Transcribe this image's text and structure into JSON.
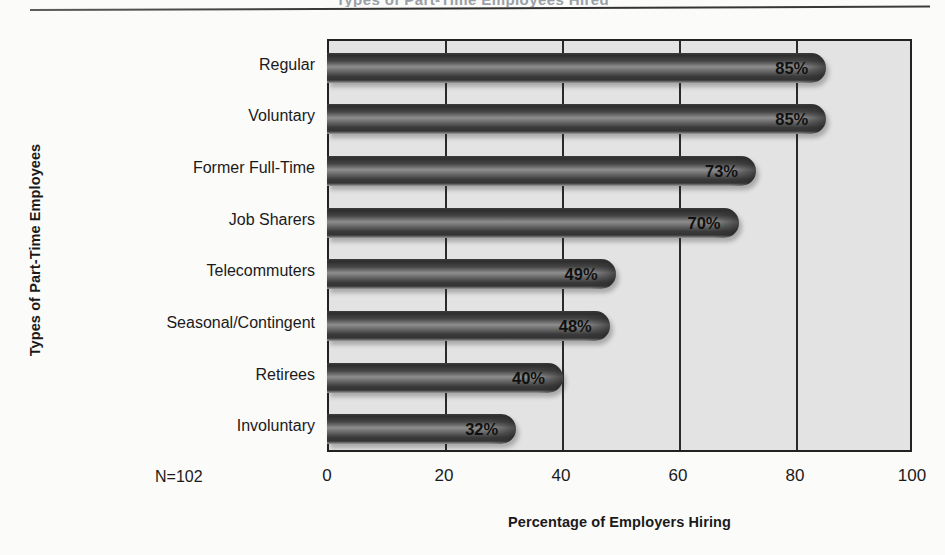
{
  "page": {
    "cropped_title": "Types of Part-Time Employees Hired",
    "sample_note": "N=102"
  },
  "chart_data": {
    "type": "bar",
    "orientation": "horizontal",
    "title": "",
    "xlabel": "Percentage of Employers Hiring",
    "ylabel": "Types of Part-Time Employees",
    "categories": [
      "Regular",
      "Voluntary",
      "Former Full-Time",
      "Job Sharers",
      "Telecommuters",
      "Seasonal/Contingent",
      "Retirees",
      "Involuntary"
    ],
    "values": [
      85,
      85,
      73,
      70,
      49,
      48,
      40,
      32
    ],
    "value_labels": [
      "85%",
      "85%",
      "73%",
      "70%",
      "49%",
      "48%",
      "40%",
      "32%"
    ],
    "xlim": [
      0,
      100
    ],
    "xticks": [
      0,
      20,
      40,
      60,
      80,
      100
    ],
    "xtick_labels": [
      "0",
      "20",
      "40",
      "60",
      "80",
      "100"
    ],
    "gridlines": [
      20,
      40,
      60,
      80
    ],
    "grid": true,
    "legend": false,
    "annotation": "N=102",
    "colors": {
      "plot_background": "#e3e3e3",
      "plot_border": "#222222",
      "gridline": "#2a2a2a",
      "bar_dark": "#2e2e2e",
      "bar_highlight": "#8e8e8e",
      "text": "#101010",
      "page_background": "#fbfbfa"
    }
  }
}
